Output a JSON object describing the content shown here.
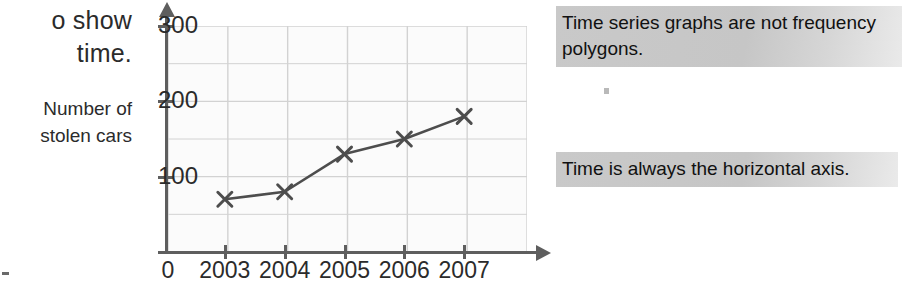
{
  "left_column": {
    "fragment_lines": [
      "o show",
      "time."
    ],
    "axis_label_lines": [
      "Number of",
      "stolen cars"
    ]
  },
  "callouts": [
    {
      "text": "Time series graphs are not frequency polygons."
    },
    {
      "text": "Time is always the horizontal axis."
    }
  ],
  "chart_data": {
    "type": "line",
    "title": "",
    "xlabel": "",
    "ylabel": "Number of stolen cars",
    "categories": [
      "2003",
      "2004",
      "2005",
      "2006",
      "2007"
    ],
    "values": [
      70,
      80,
      130,
      150,
      180
    ],
    "series": [
      {
        "name": "Number of stolen cars",
        "values": [
          70,
          80,
          130,
          150,
          180
        ]
      }
    ],
    "ylim": [
      0,
      300
    ],
    "y_tick_labels": [
      "100",
      "200",
      "300"
    ],
    "y_ticks": [
      100,
      200,
      300
    ],
    "y_gridline_step": 50,
    "x_tick_labels": [
      "2003",
      "2004",
      "2005",
      "2006",
      "2007"
    ],
    "origin_label": "0",
    "grid": true,
    "legend": "none",
    "marker": "x-cross",
    "line_color": "#4d4d4d",
    "grid_color": "#d2d2d2",
    "axis_color": "#5e5e5e",
    "plot_background": "#fbfbfb"
  },
  "colors": {
    "callout_highlight": "#c9c9c9",
    "text": "#1a1a1a",
    "page_background": "#ffffff"
  }
}
